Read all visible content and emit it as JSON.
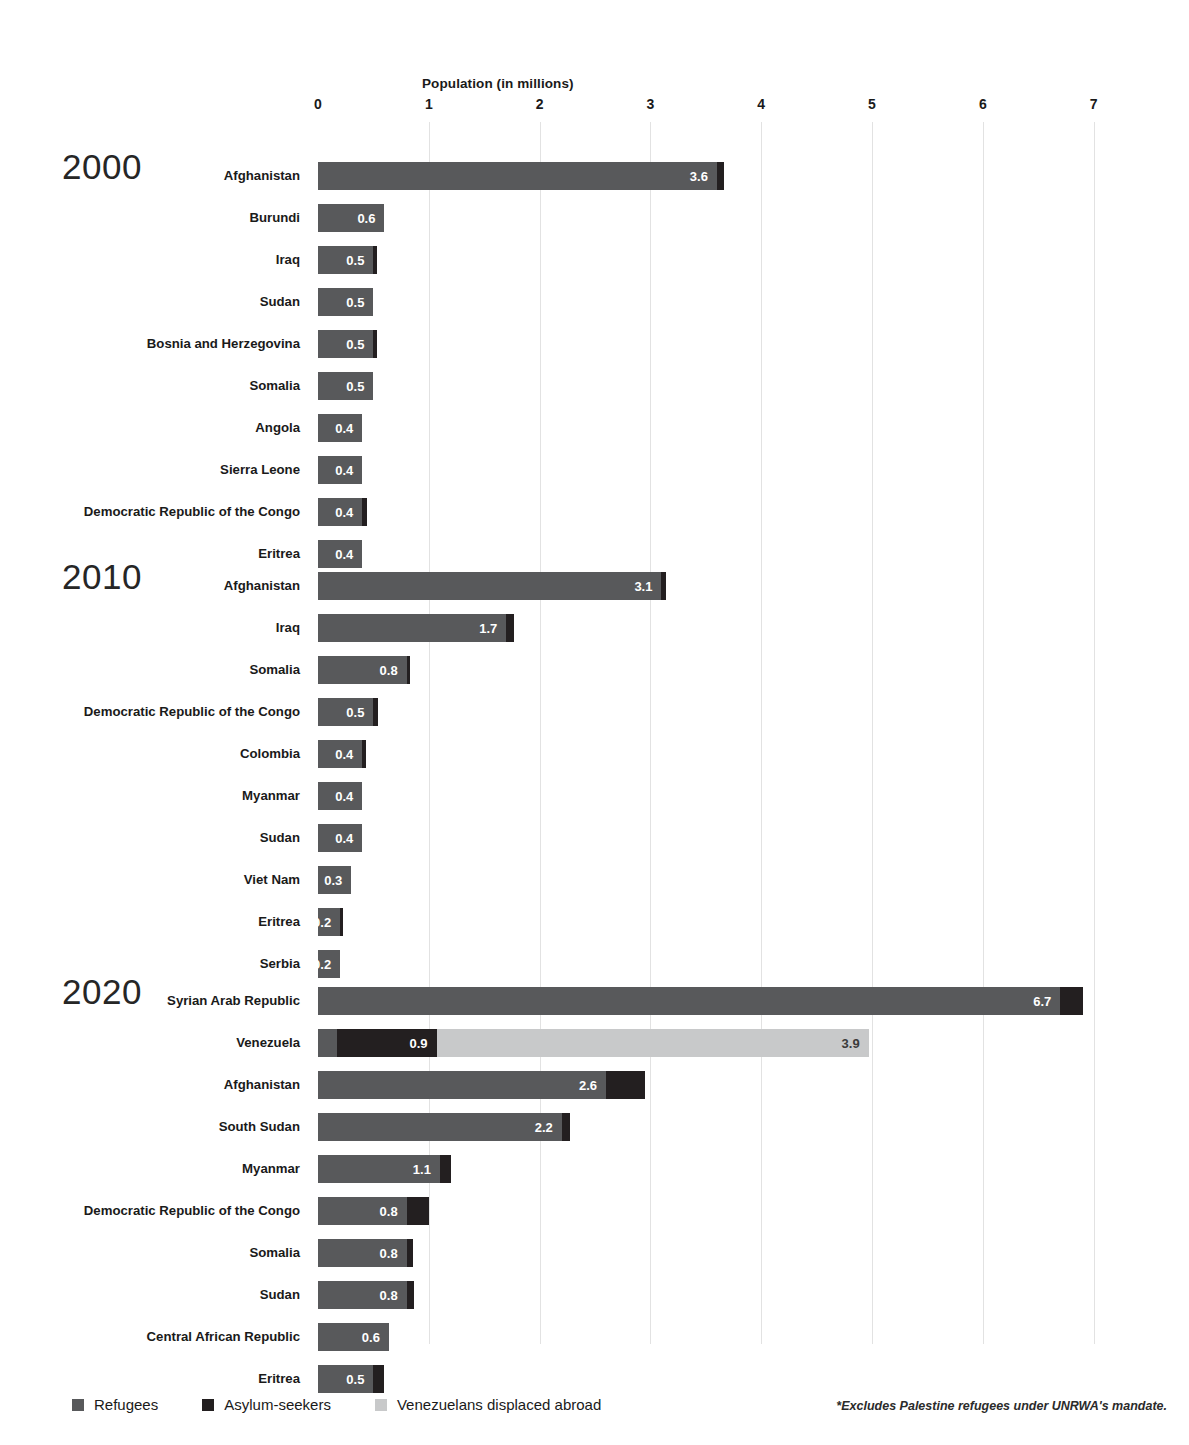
{
  "chart_data": {
    "type": "bar",
    "title": "",
    "xlabel": "Population (in millions)",
    "ylabel": "",
    "orientation": "horizontal",
    "stacked": true,
    "grid": true,
    "xlim": [
      0,
      7.45
    ],
    "xticks": [
      0,
      1,
      2,
      3,
      4,
      5,
      6,
      7
    ],
    "xtick_labels": [
      "0",
      "1",
      "2",
      "3",
      "4",
      "5",
      "6",
      "7"
    ],
    "legend_position": "bottom-left",
    "series": [
      {
        "name": "Refugees",
        "color": "#58595b"
      },
      {
        "name": "Asylum-seekers",
        "color": "#231f20"
      },
      {
        "name": "Venezuelans displaced abroad",
        "color": "#c8c9ca"
      }
    ],
    "groups": [
      {
        "year": "2000",
        "categories": [
          "Afghanistan",
          "Burundi",
          "Iraq",
          "Sudan",
          "Bosnia and Herzegovina",
          "Somalia",
          "Angola",
          "Sierra Leone",
          "Democratic Republic of the Congo",
          "Eritrea"
        ],
        "rows": [
          {
            "label": "Afghanistan",
            "segments": [
              {
                "series": "Refugees",
                "value": 3.6,
                "label": "3.6"
              },
              {
                "series": "Asylum-seekers",
                "value": 0.06,
                "label": ""
              }
            ]
          },
          {
            "label": "Burundi",
            "segments": [
              {
                "series": "Refugees",
                "value": 0.6,
                "label": "0.6"
              }
            ]
          },
          {
            "label": "Iraq",
            "segments": [
              {
                "series": "Refugees",
                "value": 0.5,
                "label": "0.5"
              },
              {
                "series": "Asylum-seekers",
                "value": 0.03,
                "label": ""
              }
            ]
          },
          {
            "label": "Sudan",
            "segments": [
              {
                "series": "Refugees",
                "value": 0.5,
                "label": "0.5"
              }
            ]
          },
          {
            "label": "Bosnia and Herzegovina",
            "segments": [
              {
                "series": "Refugees",
                "value": 0.5,
                "label": "0.5"
              },
              {
                "series": "Asylum-seekers",
                "value": 0.03,
                "label": ""
              }
            ]
          },
          {
            "label": "Somalia",
            "segments": [
              {
                "series": "Refugees",
                "value": 0.5,
                "label": "0.5"
              }
            ]
          },
          {
            "label": "Angola",
            "segments": [
              {
                "series": "Refugees",
                "value": 0.4,
                "label": "0.4"
              }
            ]
          },
          {
            "label": "Sierra Leone",
            "segments": [
              {
                "series": "Refugees",
                "value": 0.4,
                "label": "0.4"
              }
            ]
          },
          {
            "label": "Democratic Republic of the Congo",
            "segments": [
              {
                "series": "Refugees",
                "value": 0.4,
                "label": "0.4"
              },
              {
                "series": "Asylum-seekers",
                "value": 0.04,
                "label": ""
              }
            ]
          },
          {
            "label": "Eritrea",
            "segments": [
              {
                "series": "Refugees",
                "value": 0.4,
                "label": "0.4"
              }
            ]
          }
        ]
      },
      {
        "year": "2010",
        "categories": [
          "Afghanistan",
          "Iraq",
          "Somalia",
          "Democratic Republic of the Congo",
          "Colombia",
          "Myanmar",
          "Sudan",
          "Viet Nam",
          "Eritrea",
          "Serbia"
        ],
        "rows": [
          {
            "label": "Afghanistan",
            "segments": [
              {
                "series": "Refugees",
                "value": 3.1,
                "label": "3.1"
              },
              {
                "series": "Asylum-seekers",
                "value": 0.04,
                "label": ""
              }
            ]
          },
          {
            "label": "Iraq",
            "segments": [
              {
                "series": "Refugees",
                "value": 1.7,
                "label": "1.7"
              },
              {
                "series": "Asylum-seekers",
                "value": 0.07,
                "label": ""
              }
            ]
          },
          {
            "label": "Somalia",
            "segments": [
              {
                "series": "Refugees",
                "value": 0.8,
                "label": "0.8"
              },
              {
                "series": "Asylum-seekers",
                "value": 0.03,
                "label": ""
              }
            ]
          },
          {
            "label": "Democratic Republic of the Congo",
            "segments": [
              {
                "series": "Refugees",
                "value": 0.5,
                "label": "0.5"
              },
              {
                "series": "Asylum-seekers",
                "value": 0.04,
                "label": ""
              }
            ]
          },
          {
            "label": "Colombia",
            "segments": [
              {
                "series": "Refugees",
                "value": 0.4,
                "label": "0.4"
              },
              {
                "series": "Asylum-seekers",
                "value": 0.03,
                "label": ""
              }
            ]
          },
          {
            "label": "Myanmar",
            "segments": [
              {
                "series": "Refugees",
                "value": 0.4,
                "label": "0.4"
              }
            ]
          },
          {
            "label": "Sudan",
            "segments": [
              {
                "series": "Refugees",
                "value": 0.4,
                "label": "0.4"
              }
            ]
          },
          {
            "label": "Viet Nam",
            "segments": [
              {
                "series": "Refugees",
                "value": 0.3,
                "label": "0.3"
              }
            ]
          },
          {
            "label": "Eritrea",
            "segments": [
              {
                "series": "Refugees",
                "value": 0.2,
                "label": "0.2"
              },
              {
                "series": "Asylum-seekers",
                "value": 0.03,
                "label": ""
              }
            ]
          },
          {
            "label": "Serbia",
            "segments": [
              {
                "series": "Refugees",
                "value": 0.2,
                "label": "0.2"
              }
            ]
          }
        ]
      },
      {
        "year": "2020",
        "categories": [
          "Syrian Arab Republic",
          "Venezuela",
          "Afghanistan",
          "South Sudan",
          "Myanmar",
          "Democratic Republic of the Congo",
          "Somalia",
          "Sudan",
          "Central African Republic",
          "Eritrea"
        ],
        "rows": [
          {
            "label": "Syrian Arab Republic",
            "segments": [
              {
                "series": "Refugees",
                "value": 6.7,
                "label": "6.7"
              },
              {
                "series": "Asylum-seekers",
                "value": 0.2,
                "label": ""
              }
            ]
          },
          {
            "label": "Venezuela",
            "segments": [
              {
                "series": "Refugees",
                "value": 0.17,
                "label": ""
              },
              {
                "series": "Asylum-seekers",
                "value": 0.9,
                "label": "0.9"
              },
              {
                "series": "Venezuelans displaced abroad",
                "value": 3.9,
                "label": "3.9"
              }
            ]
          },
          {
            "label": "Afghanistan",
            "segments": [
              {
                "series": "Refugees",
                "value": 2.6,
                "label": "2.6"
              },
              {
                "series": "Asylum-seekers",
                "value": 0.35,
                "label": ""
              }
            ]
          },
          {
            "label": "South Sudan",
            "segments": [
              {
                "series": "Refugees",
                "value": 2.2,
                "label": "2.2"
              },
              {
                "series": "Asylum-seekers",
                "value": 0.07,
                "label": ""
              }
            ]
          },
          {
            "label": "Myanmar",
            "segments": [
              {
                "series": "Refugees",
                "value": 1.1,
                "label": "1.1"
              },
              {
                "series": "Asylum-seekers",
                "value": 0.1,
                "label": ""
              }
            ]
          },
          {
            "label": "Democratic Republic of the Congo",
            "segments": [
              {
                "series": "Refugees",
                "value": 0.8,
                "label": "0.8"
              },
              {
                "series": "Asylum-seekers",
                "value": 0.2,
                "label": ""
              }
            ]
          },
          {
            "label": "Somalia",
            "segments": [
              {
                "series": "Refugees",
                "value": 0.8,
                "label": "0.8"
              },
              {
                "series": "Asylum-seekers",
                "value": 0.06,
                "label": ""
              }
            ]
          },
          {
            "label": "Sudan",
            "segments": [
              {
                "series": "Refugees",
                "value": 0.8,
                "label": "0.8"
              },
              {
                "series": "Asylum-seekers",
                "value": 0.07,
                "label": ""
              }
            ]
          },
          {
            "label": "Central African Republic",
            "segments": [
              {
                "series": "Refugees",
                "value": 0.64,
                "label": "0.6"
              }
            ]
          },
          {
            "label": "Eritrea",
            "segments": [
              {
                "series": "Refugees",
                "value": 0.5,
                "label": "0.5"
              },
              {
                "series": "Asylum-seekers",
                "value": 0.1,
                "label": ""
              }
            ]
          }
        ]
      }
    ]
  },
  "legend": {
    "items": [
      {
        "label": "Refugees",
        "color": "#58595b"
      },
      {
        "label": "Asylum-seekers",
        "color": "#231f20"
      },
      {
        "label": "Venezuelans displaced abroad",
        "color": "#c8c9ca"
      }
    ]
  },
  "footnote": "*Excludes Palestine refugees under UNRWA's mandate."
}
